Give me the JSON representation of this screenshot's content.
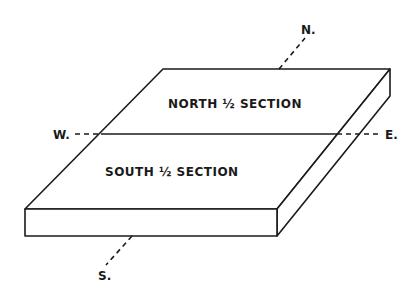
{
  "diagram": {
    "type": "isometric-block",
    "regions": [
      {
        "id": "north",
        "label": "NORTH ½ SECTION"
      },
      {
        "id": "south",
        "label": "SOUTH ½ SECTION"
      }
    ],
    "compass": {
      "north": "N.",
      "south": "S.",
      "east": "E.",
      "west": "W."
    },
    "colors": {
      "stroke": "#1a1a1a",
      "background": "#ffffff"
    }
  }
}
